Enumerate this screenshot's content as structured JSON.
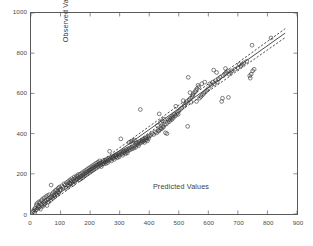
{
  "chart_data": {
    "type": "scatter",
    "title": "",
    "xlabel": "Predicted Values",
    "ylabel": "Observed Values",
    "xlim": [
      0,
      900
    ],
    "ylim": [
      0,
      1000
    ],
    "xticks": [
      0,
      100,
      200,
      300,
      400,
      500,
      600,
      700,
      800,
      900
    ],
    "yticks": [
      0,
      200,
      400,
      600,
      800,
      1000
    ],
    "xticklabels": [
      "0",
      "100",
      "200",
      "300",
      "400",
      "500",
      "600",
      "700",
      "800",
      "900"
    ],
    "yticklabels": [
      "0",
      "200",
      "400",
      "600",
      "800",
      "1000"
    ],
    "grid": false,
    "legend": null,
    "marker": "open-circle",
    "marker_color": "#3a3a3a",
    "line_color": "#2a2a2a",
    "frame_color": "#5a5a5a",
    "series": [
      {
        "name": "observations",
        "type": "scatter",
        "points": [
          [
            8,
            14
          ],
          [
            10,
            22
          ],
          [
            12,
            6
          ],
          [
            14,
            30
          ],
          [
            16,
            18
          ],
          [
            18,
            44
          ],
          [
            20,
            52
          ],
          [
            22,
            28
          ],
          [
            24,
            40
          ],
          [
            26,
            60
          ],
          [
            28,
            34
          ],
          [
            30,
            56
          ],
          [
            32,
            24
          ],
          [
            34,
            66
          ],
          [
            36,
            46
          ],
          [
            38,
            72
          ],
          [
            40,
            38
          ],
          [
            42,
            58
          ],
          [
            44,
            80
          ],
          [
            46,
            50
          ],
          [
            48,
            64
          ],
          [
            50,
            86
          ],
          [
            52,
            70
          ],
          [
            54,
            42
          ],
          [
            56,
            92
          ],
          [
            58,
            74
          ],
          [
            60,
            60
          ],
          [
            62,
            96
          ],
          [
            64,
            82
          ],
          [
            66,
            68
          ],
          [
            68,
            144
          ],
          [
            70,
            88
          ],
          [
            72,
            100
          ],
          [
            74,
            78
          ],
          [
            76,
            108
          ],
          [
            78,
            94
          ],
          [
            80,
            86
          ],
          [
            82,
            116
          ],
          [
            84,
            102
          ],
          [
            86,
            120
          ],
          [
            88,
            96
          ],
          [
            90,
            112
          ],
          [
            92,
            128
          ],
          [
            94,
            106
          ],
          [
            96,
            134
          ],
          [
            98,
            118
          ],
          [
            100,
            124
          ],
          [
            104,
            140
          ],
          [
            108,
            132
          ],
          [
            112,
            150
          ],
          [
            116,
            144
          ],
          [
            118,
            128
          ],
          [
            120,
            156
          ],
          [
            124,
            146
          ],
          [
            126,
            162
          ],
          [
            128,
            140
          ],
          [
            130,
            154
          ],
          [
            132,
            170
          ],
          [
            134,
            150
          ],
          [
            136,
            164
          ],
          [
            138,
            176
          ],
          [
            140,
            158
          ],
          [
            142,
            148
          ],
          [
            144,
            172
          ],
          [
            146,
            184
          ],
          [
            148,
            162
          ],
          [
            150,
            178
          ],
          [
            152,
            168
          ],
          [
            154,
            190
          ],
          [
            156,
            174
          ],
          [
            158,
            186
          ],
          [
            160,
            196
          ],
          [
            162,
            180
          ],
          [
            164,
            170
          ],
          [
            166,
            198
          ],
          [
            168,
            188
          ],
          [
            170,
            176
          ],
          [
            172,
            204
          ],
          [
            174,
            192
          ],
          [
            176,
            182
          ],
          [
            178,
            210
          ],
          [
            180,
            200
          ],
          [
            182,
            190
          ],
          [
            184,
            216
          ],
          [
            186,
            206
          ],
          [
            188,
            196
          ],
          [
            190,
            222
          ],
          [
            192,
            212
          ],
          [
            194,
            202
          ],
          [
            196,
            228
          ],
          [
            198,
            218
          ],
          [
            200,
            208
          ],
          [
            202,
            234
          ],
          [
            204,
            224
          ],
          [
            206,
            214
          ],
          [
            208,
            240
          ],
          [
            210,
            230
          ],
          [
            212,
            220
          ],
          [
            214,
            246
          ],
          [
            216,
            236
          ],
          [
            218,
            226
          ],
          [
            220,
            252
          ],
          [
            222,
            242
          ],
          [
            224,
            232
          ],
          [
            226,
            258
          ],
          [
            228,
            248
          ],
          [
            230,
            238
          ],
          [
            232,
            264
          ],
          [
            234,
            254
          ],
          [
            236,
            244
          ],
          [
            238,
            236
          ],
          [
            240,
            256
          ],
          [
            242,
            248
          ],
          [
            244,
            266
          ],
          [
            246,
            258
          ],
          [
            248,
            250
          ],
          [
            250,
            268
          ],
          [
            252,
            260
          ],
          [
            254,
            252
          ],
          [
            256,
            272
          ],
          [
            258,
            264
          ],
          [
            260,
            256
          ],
          [
            262,
            276
          ],
          [
            264,
            268
          ],
          [
            266,
            312
          ],
          [
            268,
            280
          ],
          [
            270,
            272
          ],
          [
            272,
            264
          ],
          [
            274,
            284
          ],
          [
            276,
            276
          ],
          [
            278,
            288
          ],
          [
            280,
            280
          ],
          [
            282,
            272
          ],
          [
            284,
            292
          ],
          [
            286,
            284
          ],
          [
            288,
            296
          ],
          [
            290,
            288
          ],
          [
            292,
            280
          ],
          [
            294,
            300
          ],
          [
            296,
            292
          ],
          [
            298,
            284
          ],
          [
            300,
            304
          ],
          [
            302,
            296
          ],
          [
            304,
            374
          ],
          [
            306,
            308
          ],
          [
            308,
            300
          ],
          [
            310,
            292
          ],
          [
            312,
            312
          ],
          [
            314,
            304
          ],
          [
            316,
            316
          ],
          [
            318,
            308
          ],
          [
            320,
            300
          ],
          [
            322,
            320
          ],
          [
            324,
            312
          ],
          [
            326,
            304
          ],
          [
            328,
            324
          ],
          [
            330,
            316
          ],
          [
            332,
            356
          ],
          [
            334,
            328
          ],
          [
            336,
            320
          ],
          [
            338,
            360
          ],
          [
            340,
            332
          ],
          [
            342,
            324
          ],
          [
            344,
            364
          ],
          [
            346,
            336
          ],
          [
            348,
            328
          ],
          [
            350,
            368
          ],
          [
            352,
            340
          ],
          [
            354,
            332
          ],
          [
            356,
            352
          ],
          [
            358,
            344
          ],
          [
            360,
            356
          ],
          [
            362,
            348
          ],
          [
            364,
            340
          ],
          [
            366,
            360
          ],
          [
            368,
            352
          ],
          [
            370,
            520
          ],
          [
            372,
            364
          ],
          [
            374,
            356
          ],
          [
            376,
            368
          ],
          [
            378,
            360
          ],
          [
            380,
            372
          ],
          [
            382,
            364
          ],
          [
            384,
            356
          ],
          [
            386,
            376
          ],
          [
            388,
            368
          ],
          [
            390,
            380
          ],
          [
            392,
            372
          ],
          [
            394,
            364
          ],
          [
            396,
            384
          ],
          [
            398,
            376
          ],
          [
            400,
            388
          ],
          [
            405,
            392
          ],
          [
            410,
            400
          ],
          [
            415,
            396
          ],
          [
            420,
            408
          ],
          [
            425,
            404
          ],
          [
            428,
            440
          ],
          [
            430,
            416
          ],
          [
            432,
            412
          ],
          [
            434,
            498
          ],
          [
            436,
            420
          ],
          [
            438,
            456
          ],
          [
            440,
            428
          ],
          [
            442,
            424
          ],
          [
            444,
            464
          ],
          [
            446,
            436
          ],
          [
            448,
            432
          ],
          [
            450,
            472
          ],
          [
            452,
            444
          ],
          [
            455,
            404
          ],
          [
            458,
            448
          ],
          [
            460,
            400
          ],
          [
            462,
            456
          ],
          [
            465,
            468
          ],
          [
            468,
            460
          ],
          [
            470,
            476
          ],
          [
            472,
            468
          ],
          [
            475,
            480
          ],
          [
            478,
            472
          ],
          [
            480,
            488
          ],
          [
            482,
            480
          ],
          [
            485,
            496
          ],
          [
            488,
            488
          ],
          [
            490,
            536
          ],
          [
            492,
            496
          ],
          [
            495,
            504
          ],
          [
            498,
            496
          ],
          [
            500,
            512
          ],
          [
            505,
            520
          ],
          [
            510,
            528
          ],
          [
            515,
            564
          ],
          [
            518,
            536
          ],
          [
            520,
            544
          ],
          [
            525,
            552
          ],
          [
            528,
            560
          ],
          [
            530,
            436
          ],
          [
            532,
            680
          ],
          [
            535,
            568
          ],
          [
            538,
            604
          ],
          [
            540,
            576
          ],
          [
            542,
            556
          ],
          [
            545,
            584
          ],
          [
            548,
            592
          ],
          [
            550,
            600
          ],
          [
            555,
            608
          ],
          [
            558,
            616
          ],
          [
            560,
            560
          ],
          [
            562,
            624
          ],
          [
            565,
            640
          ],
          [
            568,
            632
          ],
          [
            570,
            576
          ],
          [
            575,
            584
          ],
          [
            578,
            648
          ],
          [
            580,
            592
          ],
          [
            585,
            600
          ],
          [
            588,
            656
          ],
          [
            590,
            608
          ],
          [
            595,
            616
          ],
          [
            600,
            624
          ],
          [
            605,
            648
          ],
          [
            610,
            640
          ],
          [
            615,
            656
          ],
          [
            618,
            716
          ],
          [
            620,
            648
          ],
          [
            625,
            664
          ],
          [
            628,
            704
          ],
          [
            630,
            656
          ],
          [
            635,
            672
          ],
          [
            640,
            680
          ],
          [
            645,
            560
          ],
          [
            648,
            576
          ],
          [
            650,
            688
          ],
          [
            655,
            696
          ],
          [
            658,
            724
          ],
          [
            660,
            704
          ],
          [
            665,
            712
          ],
          [
            668,
            580
          ],
          [
            670,
            696
          ],
          [
            675,
            704
          ],
          [
            680,
            712
          ],
          [
            690,
            720
          ],
          [
            700,
            728
          ],
          [
            705,
            744
          ],
          [
            710,
            736
          ],
          [
            715,
            744
          ],
          [
            720,
            752
          ],
          [
            730,
            760
          ],
          [
            740,
            688
          ],
          [
            742,
            676
          ],
          [
            745,
            696
          ],
          [
            748,
            840
          ],
          [
            750,
            712
          ],
          [
            755,
            720
          ],
          [
            812,
            876
          ]
        ]
      },
      {
        "name": "regression-fit",
        "type": "line",
        "style": "solid",
        "x": [
          5,
          860
        ],
        "y": [
          8,
          900
        ]
      },
      {
        "name": "confidence-upper",
        "type": "line",
        "style": "dashed",
        "x": [
          5,
          860
        ],
        "y": [
          18,
          922
        ]
      },
      {
        "name": "confidence-lower",
        "type": "line",
        "style": "dashed",
        "x": [
          5,
          860
        ],
        "y": [
          -2,
          878
        ]
      }
    ]
  }
}
